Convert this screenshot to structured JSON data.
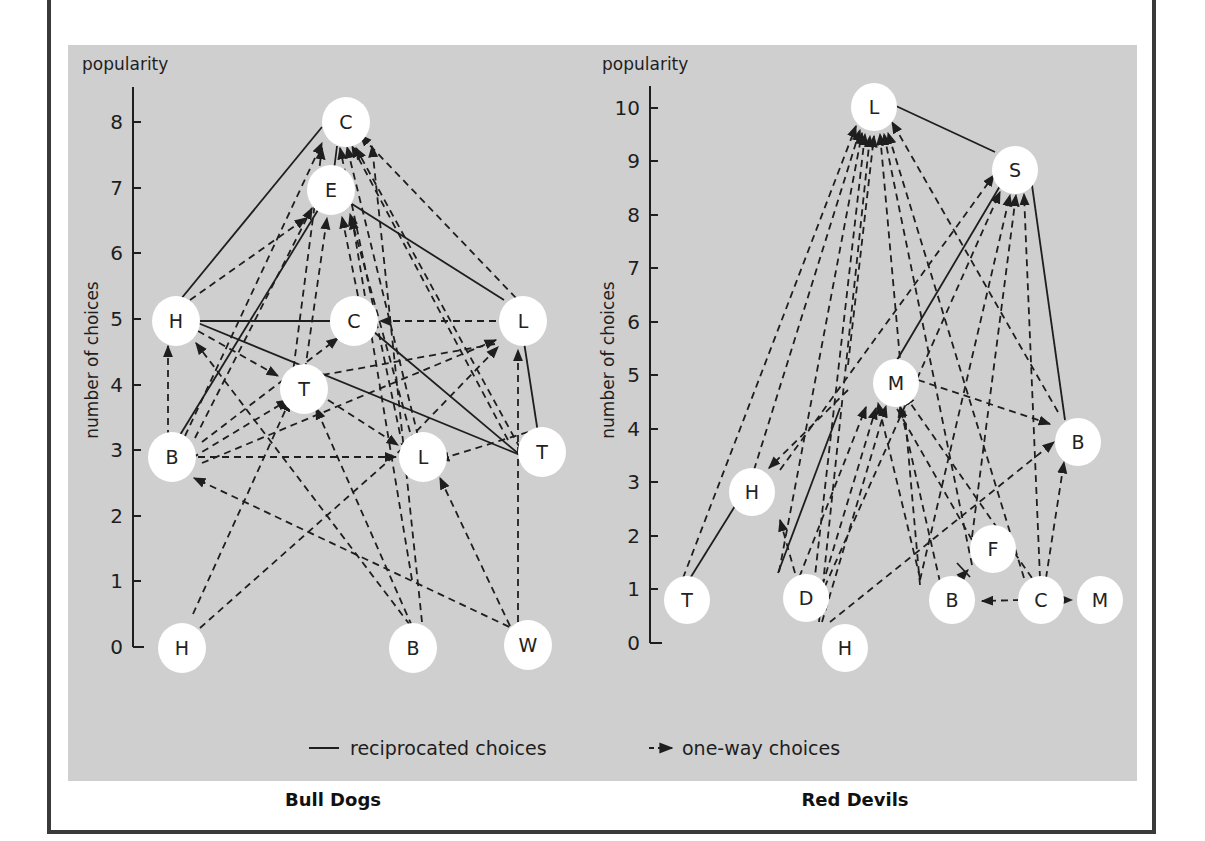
{
  "colors": {
    "panel_bg": "#cfcfcf",
    "frame": "#3a3a3a",
    "node_fill": "#ffffff",
    "line": "#1e1e1e"
  },
  "legend": {
    "reciprocated": "reciprocated choices",
    "one_way": "one-way choices"
  },
  "groups": [
    {
      "title": "Bull Dogs",
      "axis_top_label": "popularity",
      "axis_side_label": "number of choices",
      "ticks": [
        "0",
        "1",
        "2",
        "3",
        "4",
        "5",
        "6",
        "7",
        "8"
      ],
      "nodes": [
        {
          "id": "C8",
          "label": "C",
          "value": 8
        },
        {
          "id": "E7",
          "label": "E",
          "value": 7
        },
        {
          "id": "H5",
          "label": "H",
          "value": 5
        },
        {
          "id": "C5",
          "label": "C",
          "value": 5
        },
        {
          "id": "L5",
          "label": "L",
          "value": 5
        },
        {
          "id": "T4",
          "label": "T",
          "value": 4
        },
        {
          "id": "B3",
          "label": "B",
          "value": 3
        },
        {
          "id": "L3",
          "label": "L",
          "value": 3
        },
        {
          "id": "T3",
          "label": "T",
          "value": 3
        },
        {
          "id": "H0",
          "label": "H",
          "value": 0
        },
        {
          "id": "B0",
          "label": "B",
          "value": 0
        },
        {
          "id": "W0",
          "label": "W",
          "value": 0
        }
      ]
    },
    {
      "title": "Red Devils",
      "axis_top_label": "popularity",
      "axis_side_label": "number of choices",
      "ticks": [
        "0",
        "1",
        "2",
        "3",
        "4",
        "5",
        "6",
        "7",
        "8",
        "9",
        "10"
      ],
      "nodes": [
        {
          "id": "L10",
          "label": "L",
          "value": 10
        },
        {
          "id": "S9",
          "label": "S",
          "value": 9
        },
        {
          "id": "M5",
          "label": "M",
          "value": 5
        },
        {
          "id": "B4",
          "label": "B",
          "value": 4
        },
        {
          "id": "H3",
          "label": "H",
          "value": 3
        },
        {
          "id": "F2",
          "label": "F",
          "value": 2
        },
        {
          "id": "T1",
          "label": "T",
          "value": 1
        },
        {
          "id": "D1",
          "label": "D",
          "value": 1
        },
        {
          "id": "B1",
          "label": "B",
          "value": 1
        },
        {
          "id": "C1",
          "label": "C",
          "value": 1
        },
        {
          "id": "M1",
          "label": "M",
          "value": 1
        },
        {
          "id": "H0",
          "label": "H",
          "value": 0
        }
      ]
    }
  ]
}
